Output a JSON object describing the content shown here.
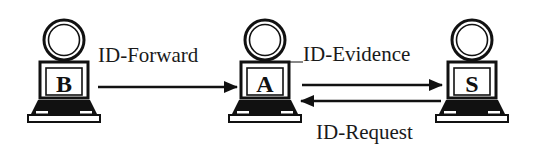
{
  "diagram": {
    "type": "network-message-flow",
    "nodes": [
      {
        "id": "B",
        "label": "B",
        "icon": "user-laptop-icon"
      },
      {
        "id": "A",
        "label": "A",
        "icon": "user-laptop-icon"
      },
      {
        "id": "S",
        "label": "S",
        "icon": "user-laptop-icon"
      }
    ],
    "edges": [
      {
        "from": "B",
        "to": "A",
        "label": "ID-Forward"
      },
      {
        "from": "A",
        "to": "S",
        "label": "ID-Evidence"
      },
      {
        "from": "S",
        "to": "A",
        "label": "ID-Request"
      }
    ]
  },
  "colors": {
    "stroke": "#111111",
    "background": "#ffffff"
  }
}
